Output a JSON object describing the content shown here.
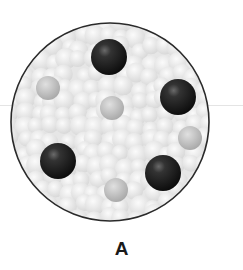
{
  "figure": {
    "label": "A",
    "container": {
      "shape": "circle",
      "cx": 110,
      "cy": 122,
      "r": 99,
      "outline_color": "#2a2a2a",
      "fill_color": "#e8e8e8"
    },
    "dark_particles": [
      {
        "cx": 109,
        "cy": 57,
        "r": 18
      },
      {
        "cx": 178,
        "cy": 97,
        "r": 18
      },
      {
        "cx": 58,
        "cy": 161,
        "r": 18
      },
      {
        "cx": 163,
        "cy": 173,
        "r": 18
      }
    ],
    "gray_particles": [
      {
        "cx": 48,
        "cy": 88,
        "r": 12
      },
      {
        "cx": 112,
        "cy": 108,
        "r": 12
      },
      {
        "cx": 190,
        "cy": 138,
        "r": 12
      },
      {
        "cx": 116,
        "cy": 190,
        "r": 12
      }
    ],
    "colors": {
      "dark_particle": "#1e1e1e",
      "gray_particle": "#b8b8b8",
      "background_particle": "#f0f0f0"
    }
  }
}
